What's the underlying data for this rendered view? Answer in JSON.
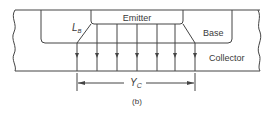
{
  "diagram": {
    "regions": {
      "emitter": "Emitter",
      "base": "Base",
      "collector": "Collector"
    },
    "labels": {
      "lb_main": "L",
      "lb_sub": "B",
      "yc_main": "Y",
      "yc_sub": "C"
    },
    "caption": "(b)",
    "arrow_count": 7,
    "colors": {
      "line": "#444444",
      "background": "#ffffff"
    }
  }
}
